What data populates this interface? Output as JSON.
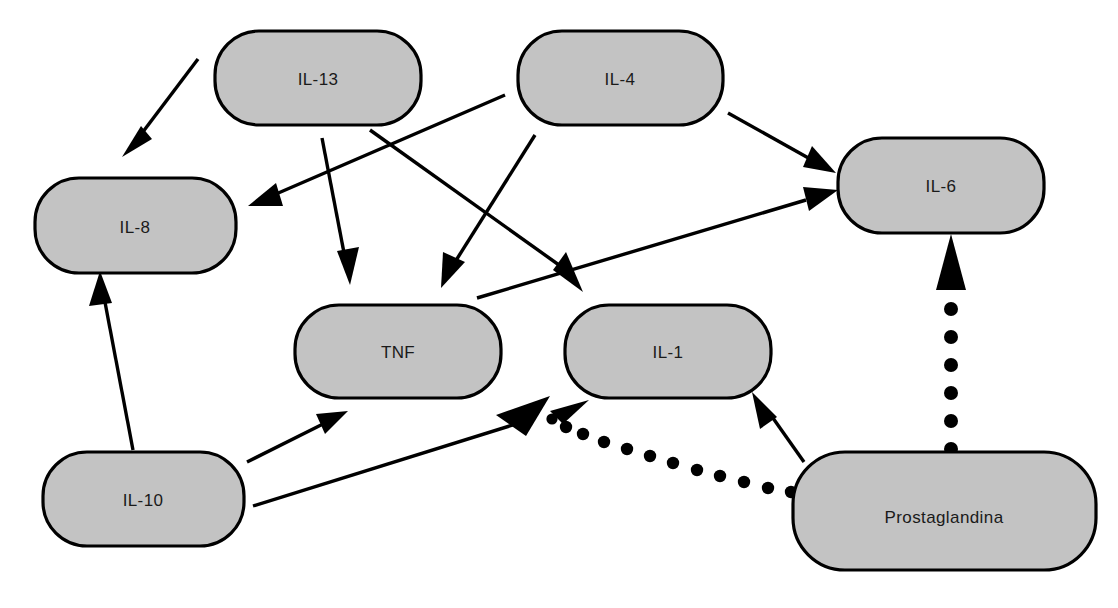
{
  "diagram": {
    "background_color": "#ffffff",
    "node_fill_color": "#c3c3c3",
    "node_stroke_color": "#000000",
    "edge_color": "#000000",
    "nodes": [
      {
        "id": "il13",
        "label": "IL-13",
        "x": 215,
        "y": 31,
        "w": 206,
        "h": 94
      },
      {
        "id": "il4",
        "label": "IL-4",
        "x": 518,
        "y": 31,
        "w": 205,
        "h": 94
      },
      {
        "id": "il8",
        "label": "IL-8",
        "x": 35,
        "y": 178,
        "w": 201,
        "h": 95
      },
      {
        "id": "il6",
        "label": "IL-6",
        "x": 838,
        "y": 138,
        "w": 206,
        "h": 95
      },
      {
        "id": "tnf",
        "label": "TNF",
        "x": 295,
        "y": 305,
        "w": 206,
        "h": 93
      },
      {
        "id": "il1",
        "label": "IL-1",
        "x": 565,
        "y": 305,
        "w": 206,
        "h": 93
      },
      {
        "id": "il10",
        "label": "IL-10",
        "x": 43,
        "y": 452,
        "w": 201,
        "h": 94
      },
      {
        "id": "prostaglandina",
        "label": "Prostaglandina",
        "x": 793,
        "y": 452,
        "w": 303,
        "h": 118
      }
    ],
    "edges": [
      {
        "id": "il13-il8",
        "from": "il13",
        "to": "il8",
        "style": "solid",
        "x1": 198,
        "y1": 59,
        "x2": 122,
        "y2": 157
      },
      {
        "id": "il13-tnf",
        "from": "il13",
        "to": "tnf",
        "style": "solid",
        "x1": 322,
        "y1": 138,
        "x2": 350,
        "y2": 285
      },
      {
        "id": "il13-il1",
        "from": "il13",
        "to": "il1",
        "style": "solid",
        "x1": 370,
        "y1": 130,
        "x2": 580,
        "y2": 291
      },
      {
        "id": "il4-il8",
        "from": "il4",
        "to": "il8",
        "style": "solid",
        "x1": 505,
        "y1": 95,
        "x2": 250,
        "y2": 205
      },
      {
        "id": "il4-tnf",
        "from": "il4",
        "to": "tnf",
        "style": "solid",
        "x1": 535,
        "y1": 135,
        "x2": 448,
        "y2": 287
      },
      {
        "id": "il4-il6",
        "from": "il4",
        "to": "il6",
        "style": "solid",
        "x1": 728,
        "y1": 113,
        "x2": 828,
        "y2": 170
      },
      {
        "id": "il10-il8",
        "from": "il10",
        "to": "il8",
        "style": "solid",
        "x1": 133,
        "y1": 450,
        "x2": 100,
        "y2": 272
      },
      {
        "id": "il10-tnf",
        "from": "il10",
        "to": "tnf",
        "style": "solid",
        "x1": 247,
        "y1": 462,
        "x2": 345,
        "y2": 412
      },
      {
        "id": "il10-tnf2",
        "from": "il10",
        "to": "tnf",
        "style": "solid",
        "x1": 253,
        "y1": 505,
        "x2": 545,
        "y2": 413
      },
      {
        "id": "il10-il6",
        "from": "il10",
        "to": "il6",
        "style": "solid",
        "x1": 477,
        "y1": 297,
        "x2": 836,
        "y2": 191
      },
      {
        "id": "pg-il1",
        "from": "prostaglandina",
        "to": "il1",
        "style": "solid",
        "x1": 800,
        "y1": 460,
        "x2": 765,
        "y2": 402
      },
      {
        "id": "pg-tnf",
        "from": "prostaglandina",
        "to": "il1",
        "style": "dotted",
        "x1": 790,
        "y1": 492,
        "x2": 552,
        "y2": 415
      },
      {
        "id": "pg-il6",
        "from": "prostaglandina",
        "to": "il6",
        "style": "dotted",
        "x1": 951,
        "y1": 452,
        "x2": 951,
        "y2": 240
      }
    ]
  }
}
